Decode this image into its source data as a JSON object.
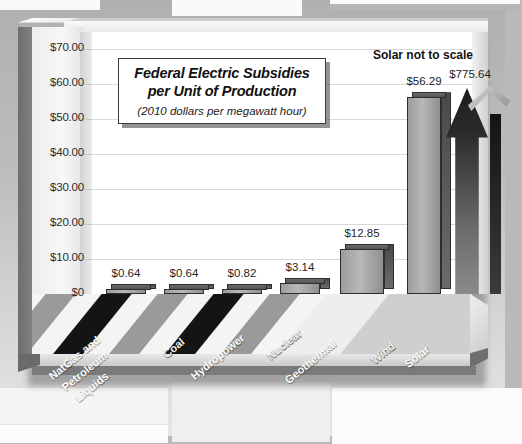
{
  "chart_data": {
    "type": "bar",
    "title_line1": "Federal Electric Subsidies",
    "title_line2": "per Unit of Production",
    "subtitle": "(2010 dollars per megawatt hour)",
    "annotation": "Solar not to scale",
    "xlabel": "",
    "ylabel": "",
    "ylim": [
      0,
      75
    ],
    "grid": true,
    "legend": "none",
    "ytick_labels": [
      "$70.00",
      "$60.00",
      "$50.00",
      "$40.00",
      "$30.00",
      "$20.00",
      "$10.00",
      "$0"
    ],
    "ytick_values": [
      70,
      60,
      50,
      40,
      30,
      20,
      10,
      0
    ],
    "categories": [
      "NatGas and Petroleum Liquids",
      "Coal",
      "Hydropower",
      "Nuclear",
      "Geothermal",
      "Wind",
      "Solar"
    ],
    "values": [
      0.64,
      0.64,
      0.82,
      3.14,
      12.85,
      56.29,
      775.64
    ],
    "value_labels": [
      "$0.64",
      "$0.64",
      "$0.82",
      "$3.14",
      "$12.85",
      "$56.29",
      "$775.64"
    ]
  },
  "axis": {
    "ticks": [
      {
        "label": "$70.00"
      },
      {
        "label": "$60.00"
      },
      {
        "label": "$50.00"
      },
      {
        "label": "$40.00"
      },
      {
        "label": "$30.00"
      },
      {
        "label": "$20.00"
      },
      {
        "label": "$10.00"
      },
      {
        "label": "$0"
      }
    ]
  },
  "bars": [
    {
      "label": "$0.64",
      "category": "NatGas and Petroleum Liquids"
    },
    {
      "label": "$0.64",
      "category": "Coal"
    },
    {
      "label": "$0.82",
      "category": "Hydropower"
    },
    {
      "label": "$3.14",
      "category": "Nuclear"
    },
    {
      "label": "$12.85",
      "category": "Geothermal"
    },
    {
      "label": "$56.29",
      "category": "Wind"
    },
    {
      "label": "$775.64",
      "category": "Solar"
    }
  ],
  "category_labels": [
    {
      "line1": "NatGas and",
      "line2": "Petroleum",
      "line3": "Liquids"
    },
    {
      "line1": "Coal"
    },
    {
      "line1": "Hydropower"
    },
    {
      "line1": "Nuclear"
    },
    {
      "line1": "Geothermal"
    },
    {
      "line1": "Wind"
    },
    {
      "line1": "Solar"
    }
  ],
  "colors": {
    "page_background": "#b9b9b9",
    "plot_background": "#ffffff",
    "gridline": "#d8d8d8",
    "bar_front": "#b8b8b8",
    "bar_side": "#4a4a4a",
    "solar_arrow": "#1d1d1d",
    "text": "#111111"
  }
}
